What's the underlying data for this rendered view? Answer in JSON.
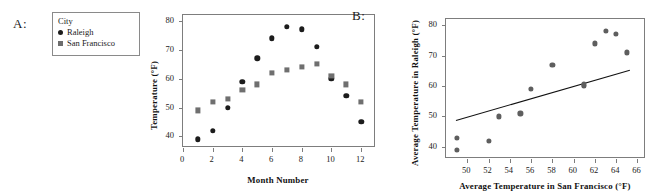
{
  "figure": {
    "panels": [
      {
        "letter": "A:",
        "legend": {
          "title": "City",
          "entries": [
            {
              "label": "Raleigh",
              "marker": "circle-marker-icon",
              "color": "#1c1c1c"
            },
            {
              "label": "San Francisco",
              "marker": "square-marker-icon",
              "color": "#6d6d6d"
            }
          ]
        }
      },
      {
        "letter": "B:"
      }
    ]
  },
  "chart_data": [
    {
      "type": "scatter",
      "panel": "A",
      "title": "",
      "xlabel": "Month Number",
      "ylabel": "Temperature (°F)",
      "xlim": [
        0,
        13
      ],
      "ylim": [
        36,
        82
      ],
      "xticks": [
        0,
        2,
        4,
        6,
        8,
        10,
        12
      ],
      "xticklabels": [
        "0",
        "2",
        "4",
        "6",
        "8",
        "10",
        "12"
      ],
      "yticks": [
        40,
        50,
        60,
        70,
        80
      ],
      "yticklabels": [
        "40",
        "50",
        "60",
        "70",
        "80"
      ],
      "grid": false,
      "legend_position": "outside-left",
      "x": [
        1,
        2,
        3,
        4,
        5,
        6,
        7,
        8,
        9,
        10,
        11,
        12
      ],
      "series": [
        {
          "name": "Raleigh",
          "marker": "circle",
          "color": "#1c1c1c",
          "values": [
            39,
            42,
            50,
            59,
            67,
            74,
            78,
            77,
            71,
            60,
            54,
            45
          ]
        },
        {
          "name": "San Francisco",
          "marker": "square",
          "color": "#6f6f6f",
          "values": [
            49,
            52,
            53,
            56,
            58,
            62,
            63,
            64,
            65,
            61,
            58,
            52
          ]
        }
      ]
    },
    {
      "type": "scatter",
      "panel": "B",
      "title": "",
      "xlabel": "Average Temperature in San Francisco (°F)",
      "ylabel": "Average Temperature in Raleigh (°F)",
      "xlim": [
        48,
        66.8
      ],
      "ylim": [
        36,
        82
      ],
      "xticks": [
        50,
        52,
        54,
        56,
        58,
        60,
        62,
        64,
        66
      ],
      "xticklabels": [
        "50",
        "52",
        "54",
        "56",
        "58",
        "60",
        "62",
        "64",
        "66"
      ],
      "yticks": [
        40,
        50,
        60,
        70,
        80
      ],
      "yticklabels": [
        "40",
        "50",
        "60",
        "70",
        "80"
      ],
      "grid": false,
      "x": [
        49,
        52,
        53,
        56,
        58,
        62,
        63,
        64,
        65,
        61,
        58,
        52
      ],
      "y": [
        39,
        42,
        50,
        59,
        67,
        74,
        78,
        77,
        71,
        60,
        54,
        45
      ],
      "points": [
        {
          "x": 49,
          "y": 39
        },
        {
          "x": 49,
          "y": 43
        },
        {
          "x": 52,
          "y": 42
        },
        {
          "x": 53,
          "y": 50
        },
        {
          "x": 55,
          "y": 51
        },
        {
          "x": 56,
          "y": 59
        },
        {
          "x": 58,
          "y": 67
        },
        {
          "x": 61,
          "y": 60
        },
        {
          "x": 61,
          "y": 60.5
        },
        {
          "x": 62,
          "y": 74
        },
        {
          "x": 63,
          "y": 78
        },
        {
          "x": 64,
          "y": 77
        },
        {
          "x": 65,
          "y": 71
        }
      ],
      "marker": "circle",
      "marker_color": "#5e5e5e",
      "trendline": {
        "type": "linear-fit",
        "x0": 48.9,
        "y0": 48.8,
        "x1": 65.2,
        "y1": 65.3,
        "color": "#111111"
      }
    }
  ]
}
